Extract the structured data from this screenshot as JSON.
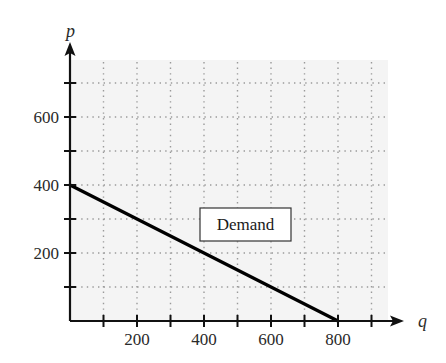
{
  "chart_data": {
    "type": "line",
    "title": "",
    "xlabel": "q",
    "ylabel": "p",
    "xlim": [
      0,
      900
    ],
    "ylim": [
      0,
      700
    ],
    "xticks": [
      100,
      200,
      300,
      400,
      500,
      600,
      700,
      800,
      900
    ],
    "xtick_labels": [
      "200",
      "400",
      "600",
      "800"
    ],
    "xtick_label_values": [
      200,
      400,
      600,
      800
    ],
    "yticks": [
      100,
      200,
      300,
      400,
      500,
      600,
      700
    ],
    "ytick_labels": [
      "200",
      "400",
      "600"
    ],
    "ytick_label_values": [
      200,
      400,
      600
    ],
    "grid": true,
    "series": [
      {
        "name": "Demand",
        "x": [
          0,
          800
        ],
        "y": [
          400,
          0
        ],
        "color": "#000000"
      }
    ],
    "annotations": [
      {
        "text": "Demand",
        "boxed": true,
        "x": 400,
        "y": 300
      }
    ]
  },
  "colors": {
    "plot_background": "#f4f4f4",
    "grid": "#9a9a9a",
    "axis": "#111111",
    "line": "#000000"
  }
}
